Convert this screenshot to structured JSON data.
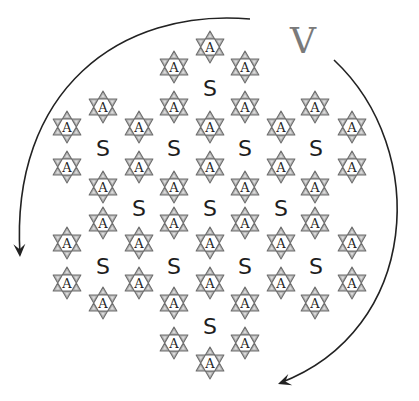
{
  "diagram": {
    "width": 419,
    "height": 401,
    "rotation_label": {
      "text": "V",
      "x": 303,
      "y": 40,
      "color": "#7a7a7a"
    },
    "colors": {
      "arrow": "#222222",
      "star_tip_fill": "#b4b4b4",
      "star_outline": "#6e6e6e",
      "star_center": "#ffffff",
      "text": "#1e1e1e"
    },
    "arrows": [
      {
        "name": "left-rotation-arrow",
        "path": "M 250 19 C 120 8, 10 90, 20 255",
        "tip": [
          20,
          257
        ],
        "direction": [
          0.05,
          1
        ]
      },
      {
        "name": "right-rotation-arrow",
        "path": "M 334 60 C 430 150, 420 330, 280 383",
        "tip": [
          278,
          384
        ],
        "direction": [
          -1,
          0.35
        ]
      }
    ],
    "star_units": {
      "label": "A",
      "radius": 16,
      "rows": [
        {
          "y": 47,
          "x": [
            210
          ]
        },
        {
          "y": 67,
          "x": [
            174,
            245
          ]
        },
        {
          "y": 107,
          "x": [
            103,
            174,
            245,
            315
          ]
        },
        {
          "y": 127,
          "x": [
            67,
            139,
            210,
            281,
            352
          ]
        },
        {
          "y": 167,
          "x": [
            67,
            139,
            210,
            281,
            352
          ]
        },
        {
          "y": 187,
          "x": [
            103,
            174,
            245,
            315
          ]
        },
        {
          "y": 223,
          "x": [
            103,
            174,
            245,
            315
          ]
        },
        {
          "y": 243,
          "x": [
            67,
            139,
            210,
            281,
            352
          ]
        },
        {
          "y": 283,
          "x": [
            67,
            139,
            210,
            281,
            352
          ]
        },
        {
          "y": 303,
          "x": [
            103,
            174,
            245,
            315
          ]
        },
        {
          "y": 343,
          "x": [
            174,
            245
          ]
        },
        {
          "y": 363,
          "x": [
            210
          ]
        }
      ]
    },
    "pore_labels": {
      "label": "S",
      "rows": [
        {
          "y": 87,
          "x": [
            210
          ]
        },
        {
          "y": 147,
          "x": [
            103,
            174,
            245,
            316
          ]
        },
        {
          "y": 207,
          "x": [
            139,
            210,
            281
          ]
        },
        {
          "y": 265,
          "x": [
            103,
            174,
            245,
            316
          ]
        },
        {
          "y": 325,
          "x": [
            210
          ]
        }
      ]
    }
  }
}
